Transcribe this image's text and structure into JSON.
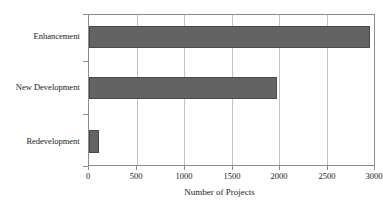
{
  "chart_data": {
    "type": "bar",
    "orientation": "horizontal",
    "title": "",
    "subtitle": "",
    "xlabel": "Number of Projects",
    "ylabel": "",
    "categories": [
      "Enhancement",
      "New Development",
      "Redevelopment"
    ],
    "values": [
      2960,
      1975,
      105
    ],
    "series": [
      {
        "name": "Number of Projects",
        "values": [
          2960,
          1975,
          105
        ]
      }
    ],
    "xlim": [
      0,
      3000
    ],
    "xticks": [
      0,
      500,
      1000,
      1500,
      2000,
      2500,
      3000
    ],
    "xtick_labels": [
      "0",
      "500",
      "1000",
      "1500",
      "2000",
      "2500",
      "3000"
    ],
    "grid": "vertical",
    "legend": "none",
    "bar_color": "#636363",
    "bar_edge_color": "#4a4a4a",
    "grid_color": "#c2c2c2",
    "axis_color": "#8c8c8c",
    "background_color": "#ffffff"
  }
}
